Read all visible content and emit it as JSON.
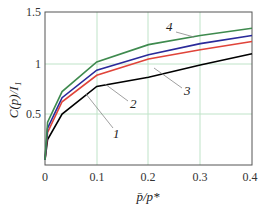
{
  "chart_data": {
    "type": "line",
    "title": "",
    "xlabel": "p̄/p*",
    "ylabel": "C(p)/I₁",
    "xlim": [
      0,
      0.4
    ],
    "ylim": [
      0,
      1.5
    ],
    "x_ticks": [
      "0",
      "0.1",
      "0.2",
      "0.3",
      "0.4"
    ],
    "y_ticks": [
      "0.5",
      "1",
      "1.5"
    ],
    "grid": true,
    "x": [
      0,
      0.005,
      0.033,
      0.1,
      0.2,
      0.3,
      0.4
    ],
    "series": [
      {
        "name": "1",
        "color": "#000000",
        "values": [
          0.05,
          0.25,
          0.5,
          0.77,
          0.86,
          0.98,
          1.09
        ]
      },
      {
        "name": "2",
        "color": "#e0443a",
        "values": [
          0.05,
          0.32,
          0.62,
          0.88,
          1.04,
          1.13,
          1.21
        ]
      },
      {
        "name": "3",
        "color": "#2a2a9a",
        "values": [
          0.05,
          0.36,
          0.66,
          0.93,
          1.08,
          1.19,
          1.27
        ]
      },
      {
        "name": "4",
        "color": "#3e8a4e",
        "values": [
          0.05,
          0.42,
          0.72,
          1.01,
          1.18,
          1.27,
          1.34
        ]
      }
    ],
    "annotations": [
      "1",
      "2",
      "3",
      "4"
    ]
  }
}
